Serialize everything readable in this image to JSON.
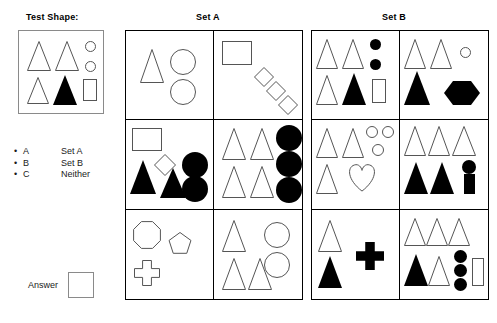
{
  "labels": {
    "test_shape": "Test Shape:",
    "set_a": "Set A",
    "set_b": "Set B",
    "answer": "Answer"
  },
  "legend": {
    "bullet_glyph": "•",
    "items": [
      {
        "key": "A",
        "value": "Set A"
      },
      {
        "key": "B",
        "value": "Set B"
      },
      {
        "key": "C",
        "value": "Neither"
      }
    ]
  },
  "answer": {
    "value": ""
  },
  "colors": {
    "fill_black": "#000000",
    "fill_white": "#ffffff",
    "stroke": "#555555",
    "panel_border": "#000000",
    "box_border": "#8a8a8a"
  },
  "test_shape": {
    "name": "test-shape-panel",
    "shapes": [
      {
        "type": "triangle",
        "fill": "white",
        "x": 8,
        "y": 10,
        "w": 24,
        "h": 30
      },
      {
        "type": "triangle",
        "fill": "white",
        "x": 36,
        "y": 10,
        "w": 24,
        "h": 30
      },
      {
        "type": "circle",
        "fill": "white",
        "x": 66,
        "y": 10,
        "w": 11,
        "h": 11
      },
      {
        "type": "circle",
        "fill": "white",
        "x": 66,
        "y": 30,
        "w": 11,
        "h": 11
      },
      {
        "type": "triangle",
        "fill": "white",
        "x": 8,
        "y": 46,
        "w": 22,
        "h": 27
      },
      {
        "type": "triangle",
        "fill": "black",
        "x": 34,
        "y": 44,
        "w": 24,
        "h": 30
      },
      {
        "type": "rect",
        "fill": "white",
        "x": 64,
        "y": 48,
        "w": 14,
        "h": 22
      }
    ]
  },
  "sets": [
    {
      "id": "set-a",
      "title": "Set A",
      "cells": [
        {
          "id": "set-a-cell-1",
          "shapes": [
            {
              "type": "triangle",
              "fill": "white",
              "x": 14,
              "y": 18,
              "w": 24,
              "h": 34
            },
            {
              "type": "circle",
              "fill": "white",
              "x": 44,
              "y": 18,
              "w": 26,
              "h": 26
            },
            {
              "type": "circle",
              "fill": "white",
              "x": 44,
              "y": 48,
              "w": 26,
              "h": 26
            }
          ]
        },
        {
          "id": "set-a-cell-2",
          "shapes": [
            {
              "type": "rect",
              "fill": "white",
              "x": 8,
              "y": 10,
              "w": 30,
              "h": 24
            },
            {
              "type": "diamond",
              "fill": "white",
              "x": 40,
              "y": 36,
              "w": 20,
              "h": 20
            },
            {
              "type": "diamond",
              "fill": "white",
              "x": 52,
              "y": 50,
              "w": 20,
              "h": 20
            },
            {
              "type": "diamond",
              "fill": "white",
              "x": 64,
              "y": 64,
              "w": 20,
              "h": 20
            }
          ]
        },
        {
          "id": "set-a-cell-3",
          "shapes": [
            {
              "type": "rect",
              "fill": "white",
              "x": 6,
              "y": 8,
              "w": 30,
              "h": 23
            },
            {
              "type": "diamond",
              "fill": "white",
              "x": 28,
              "y": 34,
              "w": 22,
              "h": 22
            },
            {
              "type": "triangle",
              "fill": "black",
              "x": 4,
              "y": 40,
              "w": 26,
              "h": 34
            },
            {
              "type": "triangle",
              "fill": "black",
              "x": 34,
              "y": 48,
              "w": 26,
              "h": 30
            },
            {
              "type": "circle",
              "fill": "black",
              "x": 56,
              "y": 32,
              "w": 26,
              "h": 26
            },
            {
              "type": "circle",
              "fill": "black",
              "x": 56,
              "y": 56,
              "w": 26,
              "h": 26
            }
          ]
        },
        {
          "id": "set-a-cell-4",
          "shapes": [
            {
              "type": "triangle",
              "fill": "white",
              "x": 8,
              "y": 8,
              "w": 24,
              "h": 32
            },
            {
              "type": "triangle",
              "fill": "white",
              "x": 36,
              "y": 8,
              "w": 24,
              "h": 32
            },
            {
              "type": "triangle",
              "fill": "white",
              "x": 8,
              "y": 46,
              "w": 24,
              "h": 32
            },
            {
              "type": "triangle",
              "fill": "white",
              "x": 36,
              "y": 46,
              "w": 24,
              "h": 32
            },
            {
              "type": "circle",
              "fill": "black",
              "x": 62,
              "y": 5,
              "w": 26,
              "h": 26
            },
            {
              "type": "circle",
              "fill": "black",
              "x": 62,
              "y": 31,
              "w": 26,
              "h": 26
            },
            {
              "type": "circle",
              "fill": "black",
              "x": 62,
              "y": 57,
              "w": 26,
              "h": 26
            }
          ]
        },
        {
          "id": "set-a-cell-5",
          "shapes": [
            {
              "type": "octagon",
              "fill": "white",
              "x": 6,
              "y": 10,
              "w": 30,
              "h": 30
            },
            {
              "type": "pentagon",
              "fill": "white",
              "x": 42,
              "y": 22,
              "w": 24,
              "h": 24
            },
            {
              "type": "cross",
              "fill": "white",
              "x": 8,
              "y": 50,
              "w": 26,
              "h": 26
            }
          ]
        },
        {
          "id": "set-a-cell-6",
          "shapes": [
            {
              "type": "triangle",
              "fill": "white",
              "x": 8,
              "y": 10,
              "w": 24,
              "h": 32
            },
            {
              "type": "circle",
              "fill": "white",
              "x": 50,
              "y": 12,
              "w": 26,
              "h": 26
            },
            {
              "type": "circle",
              "fill": "white",
              "x": 50,
              "y": 42,
              "w": 26,
              "h": 26
            },
            {
              "type": "triangle",
              "fill": "white",
              "x": 8,
              "y": 48,
              "w": 24,
              "h": 32
            },
            {
              "type": "triangle",
              "fill": "white",
              "x": 34,
              "y": 48,
              "w": 24,
              "h": 32
            }
          ]
        }
      ]
    },
    {
      "id": "set-b",
      "title": "Set B",
      "cells": [
        {
          "id": "set-b-cell-1",
          "shapes": [
            {
              "type": "triangle",
              "fill": "white",
              "x": 4,
              "y": 8,
              "w": 22,
              "h": 30
            },
            {
              "type": "triangle",
              "fill": "white",
              "x": 30,
              "y": 8,
              "w": 22,
              "h": 30
            },
            {
              "type": "circle",
              "fill": "black",
              "x": 58,
              "y": 8,
              "w": 11,
              "h": 11
            },
            {
              "type": "circle",
              "fill": "black",
              "x": 58,
              "y": 28,
              "w": 11,
              "h": 11
            },
            {
              "type": "triangle",
              "fill": "white",
              "x": 4,
              "y": 44,
              "w": 22,
              "h": 30
            },
            {
              "type": "triangle",
              "fill": "black",
              "x": 30,
              "y": 42,
              "w": 24,
              "h": 32
            },
            {
              "type": "rect",
              "fill": "white",
              "x": 60,
              "y": 48,
              "w": 14,
              "h": 24
            }
          ]
        },
        {
          "id": "set-b-cell-2",
          "shapes": [
            {
              "type": "triangle",
              "fill": "white",
              "x": 4,
              "y": 8,
              "w": 22,
              "h": 30
            },
            {
              "type": "triangle",
              "fill": "white",
              "x": 30,
              "y": 8,
              "w": 22,
              "h": 30
            },
            {
              "type": "circle",
              "fill": "white",
              "x": 60,
              "y": 16,
              "w": 11,
              "h": 11
            },
            {
              "type": "triangle",
              "fill": "black",
              "x": 4,
              "y": 40,
              "w": 26,
              "h": 34
            },
            {
              "type": "hexagon",
              "fill": "black",
              "x": 44,
              "y": 48,
              "w": 36,
              "h": 28
            }
          ]
        },
        {
          "id": "set-b-cell-3",
          "shapes": [
            {
              "type": "triangle",
              "fill": "white",
              "x": 4,
              "y": 8,
              "w": 22,
              "h": 30
            },
            {
              "type": "triangle",
              "fill": "white",
              "x": 30,
              "y": 8,
              "w": 22,
              "h": 30
            },
            {
              "type": "circle",
              "fill": "white",
              "x": 54,
              "y": 6,
              "w": 12,
              "h": 12
            },
            {
              "type": "circle",
              "fill": "white",
              "x": 70,
              "y": 6,
              "w": 12,
              "h": 12
            },
            {
              "type": "circle",
              "fill": "white",
              "x": 60,
              "y": 24,
              "w": 12,
              "h": 12
            },
            {
              "type": "triangle",
              "fill": "white",
              "x": 4,
              "y": 44,
              "w": 22,
              "h": 30
            },
            {
              "type": "heart",
              "fill": "white",
              "x": 34,
              "y": 42,
              "w": 32,
              "h": 30
            }
          ]
        },
        {
          "id": "set-b-cell-4",
          "shapes": [
            {
              "type": "triangle",
              "fill": "white",
              "x": 4,
              "y": 6,
              "w": 22,
              "h": 30
            },
            {
              "type": "triangle",
              "fill": "white",
              "x": 28,
              "y": 6,
              "w": 22,
              "h": 30
            },
            {
              "type": "triangle",
              "fill": "white",
              "x": 52,
              "y": 6,
              "w": 24,
              "h": 30
            },
            {
              "type": "triangle",
              "fill": "black",
              "x": 4,
              "y": 42,
              "w": 24,
              "h": 32
            },
            {
              "type": "triangle",
              "fill": "black",
              "x": 30,
              "y": 42,
              "w": 24,
              "h": 32
            },
            {
              "type": "circle",
              "fill": "black",
              "x": 62,
              "y": 40,
              "w": 14,
              "h": 14
            },
            {
              "type": "rect",
              "fill": "black",
              "x": 64,
              "y": 54,
              "w": 11,
              "h": 20
            }
          ]
        },
        {
          "id": "set-b-cell-5",
          "shapes": [
            {
              "type": "triangle",
              "fill": "white",
              "x": 6,
              "y": 10,
              "w": 24,
              "h": 32
            },
            {
              "type": "triangle",
              "fill": "black",
              "x": 6,
              "y": 46,
              "w": 24,
              "h": 32
            },
            {
              "type": "cross",
              "fill": "black",
              "x": 44,
              "y": 32,
              "w": 28,
              "h": 28
            }
          ]
        },
        {
          "id": "set-b-cell-6",
          "shapes": [
            {
              "type": "triangle",
              "fill": "white",
              "x": 4,
              "y": 8,
              "w": 22,
              "h": 28
            },
            {
              "type": "triangle",
              "fill": "white",
              "x": 26,
              "y": 8,
              "w": 22,
              "h": 28
            },
            {
              "type": "triangle",
              "fill": "white",
              "x": 48,
              "y": 8,
              "w": 22,
              "h": 28
            },
            {
              "type": "triangle",
              "fill": "black",
              "x": 4,
              "y": 44,
              "w": 24,
              "h": 32
            },
            {
              "type": "triangle",
              "fill": "white",
              "x": 28,
              "y": 46,
              "w": 22,
              "h": 30
            },
            {
              "type": "circle",
              "fill": "black",
              "x": 54,
              "y": 40,
              "w": 13,
              "h": 13
            },
            {
              "type": "circle",
              "fill": "black",
              "x": 54,
              "y": 54,
              "w": 13,
              "h": 13
            },
            {
              "type": "circle",
              "fill": "black",
              "x": 54,
              "y": 68,
              "w": 13,
              "h": 13
            },
            {
              "type": "rect",
              "fill": "white",
              "x": 72,
              "y": 48,
              "w": 12,
              "h": 28
            }
          ]
        }
      ]
    }
  ]
}
